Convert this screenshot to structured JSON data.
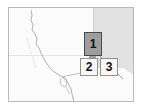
{
  "figure": {
    "type": "map-thumbnail"
  },
  "frame": {
    "border_color": "#b9b9b9",
    "background_color": "#fdfdfd"
  },
  "map": {
    "land_color": "#fbfbfb",
    "shaded_region_color": "#e2e2e2",
    "coastline_color": "#a8a8a8",
    "features": {
      "coastline_name": "coastline",
      "river_name": "river-network"
    }
  },
  "callouts": [
    {
      "id": "callout-1",
      "label": "1",
      "fill": "#9e9e9e",
      "border": "#4a4a4a",
      "text_color": "#111111"
    },
    {
      "id": "callout-2",
      "label": "2",
      "fill": "#f7f7f7",
      "border": "#909090",
      "text_color": "#111111"
    },
    {
      "id": "callout-3",
      "label": "3",
      "fill": "#f7f7f7",
      "border": "#909090",
      "text_color": "#111111"
    }
  ],
  "leader": {
    "name": "leader-line",
    "color": "#9a9a9a"
  }
}
